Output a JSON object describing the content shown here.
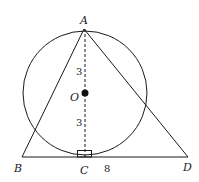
{
  "diagram": {
    "type": "geometry",
    "points": {
      "A": {
        "label": "A"
      },
      "B": {
        "label": "B"
      },
      "C": {
        "label": "C"
      },
      "D": {
        "label": "D"
      },
      "O": {
        "label": "O"
      }
    },
    "measurements": {
      "AO": "3",
      "OC": "3",
      "CD": "8"
    },
    "annotations": {
      "right_angle_at": "C"
    },
    "colors": {
      "stroke": "#1a1a1a",
      "background": "#ffffff"
    }
  }
}
